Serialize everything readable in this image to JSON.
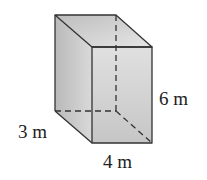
{
  "figure": {
    "type": "rectangular-prism",
    "dimensions": {
      "height": {
        "value": 6,
        "unit": "m",
        "label": "6 m"
      },
      "depth": {
        "value": 3,
        "unit": "m",
        "label": "3 m"
      },
      "width": {
        "value": 4,
        "unit": "m",
        "label": "4 m"
      }
    },
    "colors": {
      "edge": "#333333",
      "face_light": "#e2e2e2",
      "face_mid": "#cfcfcf",
      "face_dark": "#b8b8b8",
      "background": "#ffffff"
    }
  }
}
